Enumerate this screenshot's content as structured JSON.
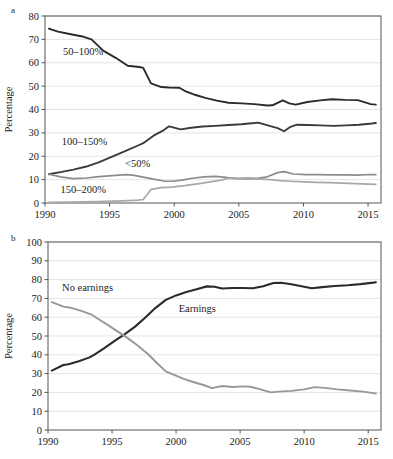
{
  "figure": {
    "panel_a_letter": "a",
    "panel_b_letter": "b"
  },
  "chart_data": [
    {
      "id": "panel-a",
      "type": "line",
      "title": "",
      "panel_label": "a",
      "xlabel": "",
      "ylabel": "Percentage",
      "xlim": [
        1990,
        2016
      ],
      "ylim": [
        0,
        80
      ],
      "ytick_step": 10,
      "xticks": [
        1990,
        1995,
        2000,
        2005,
        2010,
        2015
      ],
      "xtick_labels": [
        "1990",
        "1995",
        "2000",
        "2005",
        "2010",
        "2015"
      ],
      "yticks": [
        0,
        10,
        20,
        30,
        40,
        50,
        60,
        70,
        80
      ],
      "ytick_labels": [
        "0",
        "10",
        "20",
        "30",
        "40",
        "50",
        "60",
        "70",
        "80"
      ],
      "grid": true,
      "legend": "inline-annotations",
      "series": [
        {
          "name": "50–100%",
          "label": "50–100%",
          "color": "#2b2b2b",
          "width": 1.9,
          "label_x": 1991.4,
          "label_y": 63.5,
          "x": [
            1990.3,
            1991,
            1992,
            1993,
            1993.6,
            1994.5,
            1995.5,
            1996.4,
            1997.3,
            1997.6,
            1998.2,
            1999,
            1999.6,
            2000.4,
            2000.8,
            2001.6,
            2002.4,
            2003.3,
            2004.2,
            2005.2,
            2006.2,
            2007.2,
            2007.6,
            2008.4,
            2008.9,
            2009.4,
            2010.3,
            2011.3,
            2012.2,
            2013.2,
            2014.2,
            2015.2,
            2015.6
          ],
          "y": [
            74.6,
            73.3,
            72.2,
            71.1,
            70.0,
            65.2,
            62.0,
            58.7,
            58.2,
            57.8,
            51.2,
            49.6,
            49.4,
            49.3,
            48.0,
            46.3,
            45.0,
            43.8,
            42.9,
            42.6,
            42.3,
            41.7,
            41.8,
            43.9,
            42.6,
            42.1,
            43.2,
            43.9,
            44.4,
            44.1,
            44.0,
            42.3,
            42.1
          ]
        },
        {
          "name": "100–150%",
          "label": "100–150%",
          "color": "#3a3a3a",
          "width": 1.9,
          "label_x": 1991.3,
          "label_y": 25.0,
          "x": [
            1990.3,
            1991.2,
            1992.2,
            1993.2,
            1994.2,
            1995.2,
            1996.2,
            1997.2,
            1997.6,
            1998.4,
            1999.2,
            1999.6,
            2000.5,
            2001.3,
            2002.2,
            2003.2,
            2004.2,
            2005.2,
            2006.2,
            2006.5,
            2007.3,
            2008.0,
            2008.5,
            2009.0,
            2009.5,
            2010.3,
            2011.3,
            2012.3,
            2013.3,
            2014.3,
            2015.3,
            2015.6
          ],
          "y": [
            12.3,
            13.2,
            14.3,
            15.6,
            17.5,
            19.8,
            22.2,
            24.6,
            25.6,
            28.8,
            31.2,
            32.8,
            31.5,
            32.2,
            32.7,
            33.0,
            33.4,
            33.7,
            34.2,
            34.4,
            33.1,
            32.0,
            30.7,
            32.6,
            33.5,
            33.4,
            33.2,
            33.0,
            33.2,
            33.5,
            34.0,
            34.2
          ]
        },
        {
          "name": "<50%",
          "label": "<50%",
          "color": "#8c8c8c",
          "width": 1.7,
          "label_x": 1996.2,
          "label_y": 15.4,
          "x": [
            1990.3,
            1991.2,
            1992.2,
            1993.2,
            1994.2,
            1995.2,
            1996.2,
            1996.8,
            1997.6,
            1998.4,
            1999.2,
            1999.8,
            2000.6,
            2001.4,
            2002.3,
            2003.2,
            2004.0,
            2004.4,
            2005.0,
            2005.6,
            2006.4,
            2007.2,
            2008.0,
            2008.5,
            2009.2,
            2010.2,
            2011.2,
            2012.2,
            2013.2,
            2014.2,
            2015.2,
            2015.6
          ],
          "y": [
            12.3,
            11.2,
            10.4,
            10.7,
            11.3,
            11.7,
            12.1,
            11.9,
            11.1,
            10.2,
            9.4,
            9.3,
            9.8,
            10.6,
            11.2,
            11.4,
            11.0,
            10.6,
            10.5,
            10.6,
            10.5,
            11.2,
            13.0,
            13.4,
            12.4,
            12.1,
            12.1,
            12.0,
            12.0,
            11.9,
            12.2,
            12.1
          ]
        },
        {
          "name": "150–200%",
          "label": "150–200%",
          "color": "#a8a8a8",
          "width": 1.7,
          "label_x": 1991.2,
          "label_y": 4.2,
          "x": [
            1990.3,
            1992.0,
            1994.0,
            1996.0,
            1997.2,
            1997.6,
            1998.2,
            1999.0,
            1999.8,
            2000.8,
            2001.8,
            2002.8,
            2003.6,
            2004.2,
            2004.6,
            2005.4,
            2006.4,
            2007.4,
            2008.2,
            2009.0,
            2010.0,
            2011.0,
            2012.0,
            2013.0,
            2014.0,
            2015.0,
            2015.6
          ],
          "y": [
            0.3,
            0.4,
            0.6,
            0.9,
            1.2,
            1.5,
            5.8,
            6.6,
            6.8,
            7.4,
            8.2,
            9.0,
            9.8,
            10.6,
            10.4,
            10.2,
            10.3,
            10.0,
            9.6,
            9.3,
            9.0,
            8.8,
            8.7,
            8.5,
            8.3,
            8.1,
            8.0
          ]
        }
      ]
    },
    {
      "id": "panel-b",
      "type": "line",
      "title": "",
      "panel_label": "b",
      "xlabel": "",
      "ylabel": "Percentage",
      "xlim": [
        1990,
        2016
      ],
      "ylim": [
        0,
        100
      ],
      "ytick_step": 10,
      "xticks": [
        1990,
        1995,
        2000,
        2005,
        2010,
        2015
      ],
      "xtick_labels": [
        "1990",
        "1995",
        "2000",
        "2005",
        "2010",
        "2015"
      ],
      "yticks": [
        0,
        10,
        20,
        30,
        40,
        50,
        60,
        70,
        80,
        90,
        100
      ],
      "ytick_labels": [
        "0",
        "10",
        "20",
        "30",
        "40",
        "50",
        "60",
        "70",
        "80",
        "90",
        "100"
      ],
      "grid": true,
      "legend": "inline-annotations",
      "series": [
        {
          "name": "Earnings",
          "label": "Earnings",
          "color": "#2b2b2b",
          "width": 2.1,
          "label_x": 2000.2,
          "label_y": 63.0,
          "x": [
            1990.3,
            1991.2,
            1991.6,
            1992.4,
            1993.2,
            1993.6,
            1994.4,
            1995.2,
            1996.0,
            1996.8,
            1997.6,
            1998.4,
            1999.2,
            2000.0,
            2000.8,
            2001.6,
            2002.4,
            2003.0,
            2003.6,
            2004.4,
            2005.2,
            2006.0,
            2006.8,
            2007.6,
            2008.2,
            2009.0,
            2010.0,
            2010.6,
            2011.4,
            2012.4,
            2013.4,
            2014.4,
            2015.4,
            2015.6
          ],
          "y": [
            31.6,
            34.6,
            35.0,
            36.6,
            38.5,
            40.0,
            43.5,
            47.4,
            51.0,
            55.0,
            59.8,
            65.0,
            69.2,
            71.6,
            73.4,
            74.9,
            76.4,
            76.2,
            75.3,
            75.5,
            75.5,
            75.4,
            76.5,
            78.2,
            78.3,
            77.5,
            76.2,
            75.4,
            76.0,
            76.6,
            77.0,
            77.6,
            78.4,
            78.6
          ]
        },
        {
          "name": "No earnings",
          "label": "No earnings",
          "color": "#989898",
          "width": 1.9,
          "label_x": 1991.1,
          "label_y": 74.0,
          "x": [
            1990.3,
            1991.2,
            1991.8,
            1992.6,
            1993.4,
            1993.8,
            1994.6,
            1995.4,
            1996.2,
            1997.0,
            1997.8,
            1998.6,
            1999.2,
            1999.8,
            2000.6,
            2001.4,
            2002.2,
            2002.8,
            2003.6,
            2004.4,
            2005.2,
            2005.8,
            2006.6,
            2007.4,
            2008.0,
            2009.0,
            2010.0,
            2010.8,
            2011.6,
            2012.6,
            2013.6,
            2014.6,
            2015.4,
            2015.6
          ],
          "y": [
            68.0,
            65.6,
            65.0,
            63.4,
            61.4,
            59.6,
            56.2,
            52.6,
            49.0,
            45.0,
            40.4,
            35.0,
            31.2,
            29.4,
            27.2,
            25.4,
            23.8,
            22.3,
            23.4,
            22.9,
            23.2,
            23.0,
            21.6,
            20.0,
            20.4,
            20.8,
            21.6,
            22.8,
            22.4,
            21.6,
            21.0,
            20.4,
            19.6,
            19.4
          ]
        }
      ]
    }
  ]
}
